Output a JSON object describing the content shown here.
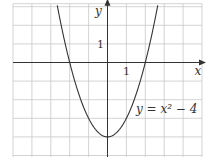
{
  "chart_data": {
    "type": "line",
    "title": "",
    "equation_label": "y = x² − 4",
    "xlabel": "x",
    "ylabel": "y",
    "xlim": [
      -5,
      5
    ],
    "ylim": [
      -5,
      3
    ],
    "grid": true,
    "x_tick_labels": [
      {
        "value": 1,
        "label": "1"
      }
    ],
    "y_tick_labels": [
      {
        "value": 1,
        "label": "1"
      }
    ],
    "series": [
      {
        "name": "y = x² − 4",
        "function": "x^2 - 4",
        "x": [
          -2.65,
          -2.5,
          -2,
          -1.5,
          -1,
          -0.5,
          0,
          0.5,
          1,
          1.5,
          2,
          2.5,
          2.65
        ],
        "y": [
          3.02,
          2.25,
          0,
          -1.75,
          -3,
          -3.75,
          -4,
          -3.75,
          -3,
          -1.75,
          0,
          2.25,
          3.02
        ]
      }
    ],
    "annotations": [
      {
        "text": "y = x² − 4",
        "x": 2.3,
        "y": -2.6
      }
    ]
  },
  "colors": {
    "grid": "#c8c8c8",
    "axis": "#333333",
    "curve": "#333333",
    "background": "#ffffff"
  }
}
